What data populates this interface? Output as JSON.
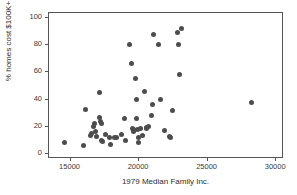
{
  "chart_data": {
    "type": "scatter",
    "title": "",
    "xlabel": "1979 Median Family Inc.",
    "ylabel": "% homes cost $100K+",
    "xlim": [
      13500,
      30500
    ],
    "ylim": [
      -3,
      103
    ],
    "xticks": [
      15000,
      20000,
      25000,
      30000
    ],
    "yticks": [
      0,
      20,
      40,
      60,
      80,
      100
    ],
    "xtick_labels": [
      "15000",
      "20000",
      "25000",
      "30000"
    ],
    "ytick_labels": [
      "0",
      "20",
      "40",
      "60",
      "80",
      "100"
    ],
    "grid": false,
    "legend": null,
    "marker": {
      "shape": "circle",
      "color": "#4d4d4d",
      "size": 5
    },
    "points": [
      {
        "x": 14600,
        "y": 8.0
      },
      {
        "x": 16000,
        "y": 5.5
      },
      {
        "x": 16150,
        "y": 32.0
      },
      {
        "x": 16500,
        "y": 12.5
      },
      {
        "x": 16600,
        "y": 14.5
      },
      {
        "x": 16750,
        "y": 19.5
      },
      {
        "x": 16800,
        "y": 21.5
      },
      {
        "x": 16900,
        "y": 16.0
      },
      {
        "x": 17000,
        "y": 12.0
      },
      {
        "x": 17150,
        "y": 44.5
      },
      {
        "x": 17200,
        "y": 26.0
      },
      {
        "x": 17250,
        "y": 23.0
      },
      {
        "x": 17300,
        "y": 21.5
      },
      {
        "x": 17350,
        "y": 9.0
      },
      {
        "x": 17400,
        "y": 8.5
      },
      {
        "x": 17650,
        "y": 13.5
      },
      {
        "x": 17900,
        "y": 11.5
      },
      {
        "x": 18000,
        "y": 6.5
      },
      {
        "x": 18300,
        "y": 11.0
      },
      {
        "x": 18450,
        "y": 11.5
      },
      {
        "x": 18800,
        "y": 13.5
      },
      {
        "x": 19000,
        "y": 25.5
      },
      {
        "x": 19100,
        "y": 9.0
      },
      {
        "x": 19400,
        "y": 80.0
      },
      {
        "x": 19550,
        "y": 65.5
      },
      {
        "x": 19600,
        "y": 18.0
      },
      {
        "x": 19650,
        "y": 16.0
      },
      {
        "x": 19700,
        "y": 17.5
      },
      {
        "x": 19800,
        "y": 54.5
      },
      {
        "x": 19850,
        "y": 39.5
      },
      {
        "x": 19900,
        "y": 25.5
      },
      {
        "x": 19950,
        "y": 17.5
      },
      {
        "x": 20000,
        "y": 11.0
      },
      {
        "x": 20050,
        "y": 7.5
      },
      {
        "x": 20200,
        "y": 18.0
      },
      {
        "x": 20350,
        "y": 12.5
      },
      {
        "x": 20500,
        "y": 45.0
      },
      {
        "x": 20600,
        "y": 19.0
      },
      {
        "x": 20650,
        "y": 18.0
      },
      {
        "x": 20750,
        "y": 19.5
      },
      {
        "x": 21000,
        "y": 27.5
      },
      {
        "x": 21050,
        "y": 35.5
      },
      {
        "x": 21150,
        "y": 87.5
      },
      {
        "x": 21500,
        "y": 79.5
      },
      {
        "x": 21600,
        "y": 39.0
      },
      {
        "x": 21900,
        "y": 16.5
      },
      {
        "x": 22300,
        "y": 12.0
      },
      {
        "x": 22350,
        "y": 11.5
      },
      {
        "x": 22500,
        "y": 31.5
      },
      {
        "x": 22900,
        "y": 89.0
      },
      {
        "x": 22950,
        "y": 79.5
      },
      {
        "x": 23000,
        "y": 58.0
      },
      {
        "x": 23200,
        "y": 91.5
      },
      {
        "x": 28300,
        "y": 37.0
      }
    ]
  }
}
